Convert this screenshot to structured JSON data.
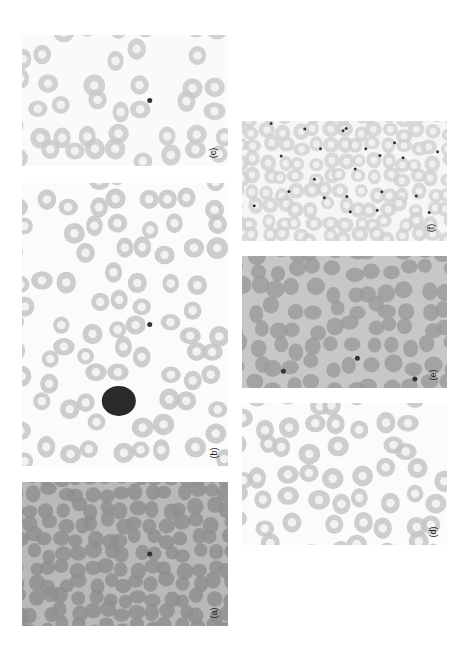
{
  "figure": {
    "orientation": "rotated-90-ccw",
    "panels": [
      {
        "id": "a",
        "label": "(a)",
        "x": 22,
        "y": 482,
        "w": 206,
        "h": 144,
        "bg": "#b9b9b9",
        "cell": "#8f8f8f",
        "pale_center": false,
        "density": "packed",
        "dark_dots": 1
      },
      {
        "id": "b",
        "label": "(b)",
        "x": 22,
        "y": 183,
        "w": 206,
        "h": 283,
        "bg": "#fbfbfb",
        "cell": "#c4c4c4",
        "pale_center": true,
        "density": "sparse",
        "dark_dots": 1,
        "lymphocyte": true
      },
      {
        "id": "c",
        "label": "(c)",
        "x": 22,
        "y": 35,
        "w": 206,
        "h": 131,
        "bg": "#fafafa",
        "cell": "#c9c9c9",
        "pale_center": true,
        "density": "sparse",
        "dark_dots": 1
      },
      {
        "id": "d",
        "label": "(d)",
        "x": 242,
        "y": 403,
        "w": 205,
        "h": 142,
        "bg": "#fbfbfb",
        "cell": "#c6c6c6",
        "pale_center": true,
        "density": "sparse",
        "dark_dots": 0
      },
      {
        "id": "e",
        "label": "(e)",
        "x": 242,
        "y": 256,
        "w": 205,
        "h": 132,
        "bg": "#c7c7c7",
        "cell": "#9c9c9c",
        "pale_center": false,
        "density": "medium",
        "dark_dots": 3
      },
      {
        "id": "f",
        "label": "(f)",
        "x": 242,
        "y": 121,
        "w": 205,
        "h": 120,
        "bg": "#f6f6f6",
        "cell": "#d2d2d2",
        "pale_center": true,
        "density": "packed",
        "dark_dots": 22
      }
    ]
  }
}
